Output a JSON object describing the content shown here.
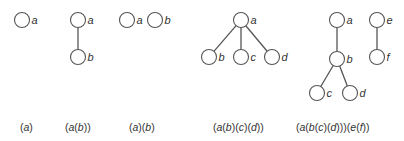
{
  "diagram": {
    "node_style": {
      "stroke": "#555555",
      "fill": "#ffffff",
      "radius": 7.5
    },
    "figures": [
      {
        "id": "fig1",
        "caption": "(a)",
        "nodes": [
          {
            "id": "a",
            "label": "a",
            "x": 22,
            "y": 20
          }
        ],
        "edges": []
      },
      {
        "id": "fig2",
        "caption": "(a(b))",
        "nodes": [
          {
            "id": "a",
            "label": "a",
            "x": 78,
            "y": 20
          },
          {
            "id": "b",
            "label": "b",
            "x": 78,
            "y": 57
          }
        ],
        "edges": [
          [
            "a",
            "b"
          ]
        ]
      },
      {
        "id": "fig3",
        "caption": "(a)(b)",
        "nodes": [
          {
            "id": "a",
            "label": "a",
            "x": 127,
            "y": 20
          },
          {
            "id": "b",
            "label": "b",
            "x": 155,
            "y": 20
          }
        ],
        "edges": []
      },
      {
        "id": "fig4",
        "caption": "(a(b)(c)(d))",
        "nodes": [
          {
            "id": "a",
            "label": "a",
            "x": 241,
            "y": 20
          },
          {
            "id": "b",
            "label": "b",
            "x": 209,
            "y": 57
          },
          {
            "id": "c",
            "label": "c",
            "x": 241,
            "y": 57
          },
          {
            "id": "d",
            "label": "d",
            "x": 272,
            "y": 57
          }
        ],
        "edges": [
          [
            "a",
            "b"
          ],
          [
            "a",
            "c"
          ],
          [
            "a",
            "d"
          ]
        ]
      },
      {
        "id": "fig5",
        "caption": "(a(b(c)(d)))(e(f))",
        "nodes": [
          {
            "id": "a",
            "label": "a",
            "x": 337,
            "y": 20
          },
          {
            "id": "b",
            "label": "b",
            "x": 337,
            "y": 59
          },
          {
            "id": "c",
            "label": "c",
            "x": 317,
            "y": 93
          },
          {
            "id": "d",
            "label": "d",
            "x": 350,
            "y": 93
          },
          {
            "id": "e",
            "label": "e",
            "x": 377,
            "y": 20
          },
          {
            "id": "f",
            "label": "f",
            "x": 377,
            "y": 57
          }
        ],
        "edges": [
          [
            "a",
            "b"
          ],
          [
            "b",
            "c"
          ],
          [
            "b",
            "d"
          ],
          [
            "e",
            "f"
          ]
        ]
      }
    ],
    "captions": [
      {
        "text": "(a)",
        "x": 20
      },
      {
        "text": "(a(b))",
        "x": 65
      },
      {
        "text": "(a)(b)",
        "x": 129
      },
      {
        "text": "(a(b)(c)(d))",
        "x": 213
      },
      {
        "text": "(a(b(c)(d)))(e(f))",
        "x": 296
      }
    ]
  }
}
